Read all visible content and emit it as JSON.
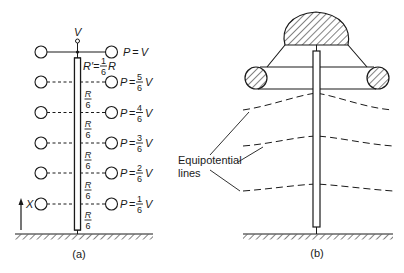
{
  "panel_a": {
    "caption": "(a)",
    "source_label": "V",
    "resistor_top_label": {
      "lhs": "R′=",
      "num": "1",
      "den": "6",
      "rhs": "R"
    },
    "segment_label": {
      "num": "R",
      "den": "6"
    },
    "axis_label": "X",
    "rows": [
      {
        "lhs": "P",
        "eq": "=",
        "num": "",
        "den": "",
        "rhs": "V",
        "dashed": false
      },
      {
        "lhs": "P",
        "eq": "=",
        "num": "5",
        "den": "6",
        "rhs": "V",
        "dashed": true
      },
      {
        "lhs": "P",
        "eq": "=",
        "num": "4",
        "den": "6",
        "rhs": "V",
        "dashed": true
      },
      {
        "lhs": "P",
        "eq": "=",
        "num": "3",
        "den": "6",
        "rhs": "V",
        "dashed": true
      },
      {
        "lhs": "P",
        "eq": "=",
        "num": "2",
        "den": "6",
        "rhs": "V",
        "dashed": true
      },
      {
        "lhs": "P",
        "eq": "=",
        "num": "1",
        "den": "6",
        "rhs": "V",
        "dashed": true
      }
    ]
  },
  "panel_b": {
    "caption": "(b)",
    "label_line1": "Equipotential",
    "label_line2": "lines",
    "equipotential_count": 3
  },
  "colors": {
    "ink": "#1a1a1a",
    "background": "#ffffff"
  }
}
